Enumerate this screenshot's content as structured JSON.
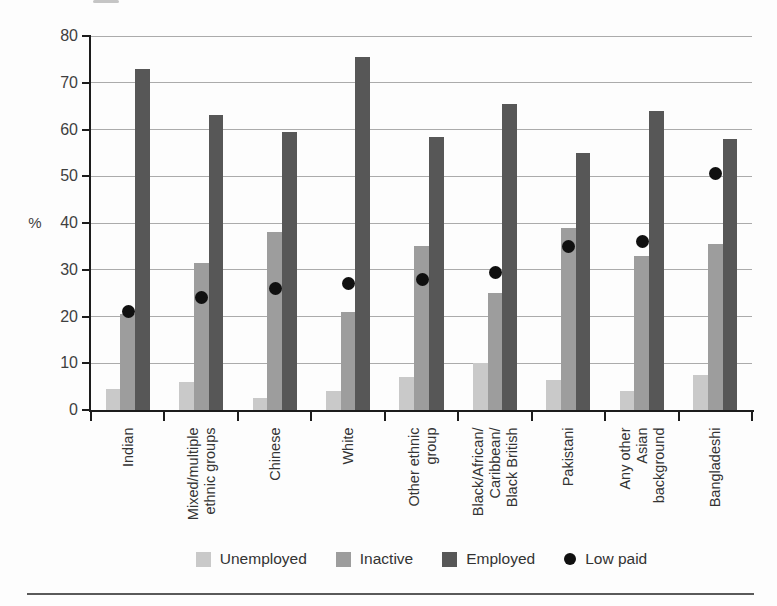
{
  "chart_data": {
    "type": "bar",
    "ylabel": "%",
    "ylim": [
      0,
      80
    ],
    "ytick_step": 10,
    "grid": true,
    "legend_position": "bottom",
    "categories": [
      "Indian",
      "Mixed/multiple\nethnic groups",
      "Chinese",
      "White",
      "Other ethnic\ngroup",
      "Black/African/\nCaribbean/\nBlack British",
      "Pakistani",
      "Any other\nAsian\nbackground",
      "Bangladeshi"
    ],
    "series": [
      {
        "name": "Unemployed",
        "type": "bar",
        "color": "#c9c9c9",
        "values": [
          4.5,
          6,
          2.5,
          4,
          7,
          10,
          6.5,
          4,
          7.5
        ]
      },
      {
        "name": "Inactive",
        "type": "bar",
        "color": "#9d9d9d",
        "values": [
          20.5,
          31.5,
          38,
          21,
          35,
          25,
          39,
          33,
          35.5
        ]
      },
      {
        "name": "Employed",
        "type": "bar",
        "color": "#575757",
        "values": [
          73,
          63,
          59.5,
          75.5,
          58.5,
          65.5,
          55,
          64,
          58
        ]
      },
      {
        "name": "Low paid",
        "type": "point",
        "color": "#101010",
        "values": [
          21,
          24,
          26,
          27,
          28,
          29.5,
          35,
          36,
          50.5
        ]
      }
    ]
  },
  "colors": {
    "axis": "#1c1c1c",
    "gridline": "#8f8f8f",
    "text": "#3a3a3a",
    "rule": "#5a5a5a"
  }
}
